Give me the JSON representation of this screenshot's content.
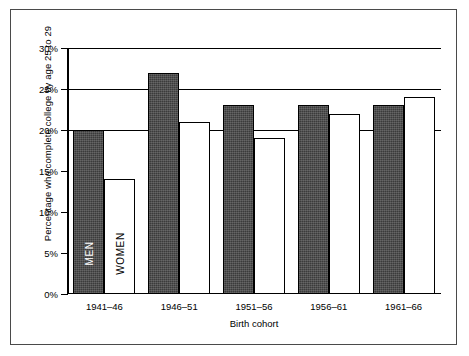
{
  "chart_data": {
    "type": "bar",
    "title": "",
    "xlabel": "Birth cohort",
    "ylabel": "Percentage who complete college by age 25 to 29",
    "categories": [
      "1941–46",
      "1946–51",
      "1951–56",
      "1956–61",
      "1961–66"
    ],
    "series": [
      {
        "name": "MEN",
        "values": [
          20,
          27,
          23,
          23,
          23
        ],
        "color": "#3b3b3b"
      },
      {
        "name": "WOMEN",
        "values": [
          14,
          21,
          19,
          22,
          24
        ],
        "color": "#ffffff"
      }
    ],
    "ylim": [
      0,
      30
    ],
    "ytick_values": [
      0,
      5,
      10,
      15,
      20,
      25,
      30
    ],
    "ytick_labels": [
      "0%",
      "5%",
      "10%",
      "15%",
      "20%",
      "25%",
      "30%"
    ],
    "gridlines_at": [
      20,
      25,
      30
    ],
    "grid": true,
    "legend_position": "in-bar",
    "inbar_labels": [
      "MEN",
      "WOMEN"
    ],
    "border_color": "#4a4a4a"
  }
}
